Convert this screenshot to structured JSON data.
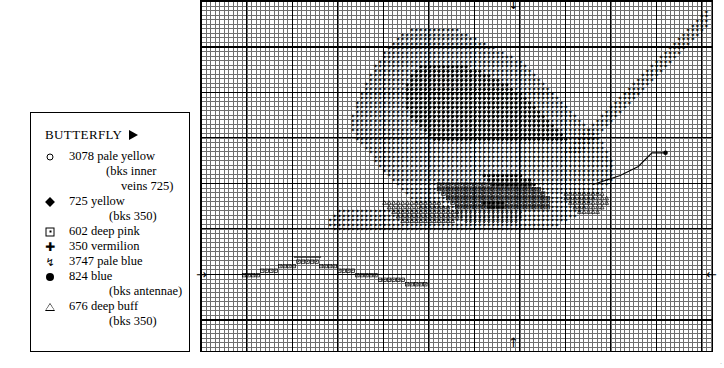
{
  "legend": {
    "title": "BUTTERFLY",
    "title_marker_icon": "triangle-right-icon",
    "items": [
      {
        "symbol": "circle-open",
        "code": "3078",
        "color": "pale yellow",
        "notes": [
          "(bks inner",
          "veins 725)"
        ]
      },
      {
        "symbol": "diamond-filled",
        "code": "725",
        "color": "yellow",
        "notes": [
          "(bks 350)"
        ]
      },
      {
        "symbol": "square-dot",
        "code": "602",
        "color": "deep pink",
        "notes": []
      },
      {
        "symbol": "club",
        "code": "350",
        "color": "vermilion",
        "notes": []
      },
      {
        "symbol": "arrow-down",
        "code": "3747",
        "color": "pale blue",
        "notes": []
      },
      {
        "symbol": "circle-filled",
        "code": "824",
        "color": "blue",
        "notes": [
          "(bks antennae)"
        ]
      },
      {
        "symbol": "triangle-open",
        "code": "676",
        "color": "deep buff",
        "notes": [
          "(bks 350)"
        ]
      }
    ]
  },
  "chart": {
    "name": "cross-stitch-pattern-grid",
    "cell_px": 4.55,
    "bold_every": 10,
    "cols": 112,
    "rows": 77,
    "centre_markers": {
      "top": "arrow-down",
      "bottom": "arrow-up",
      "left": "arrow-right",
      "right": "arrow-left"
    },
    "colors": {
      "fine_grid": "#6f6f6f",
      "bold_grid": "#000000",
      "ink": "#000000"
    },
    "corner_mark": "·"
  }
}
